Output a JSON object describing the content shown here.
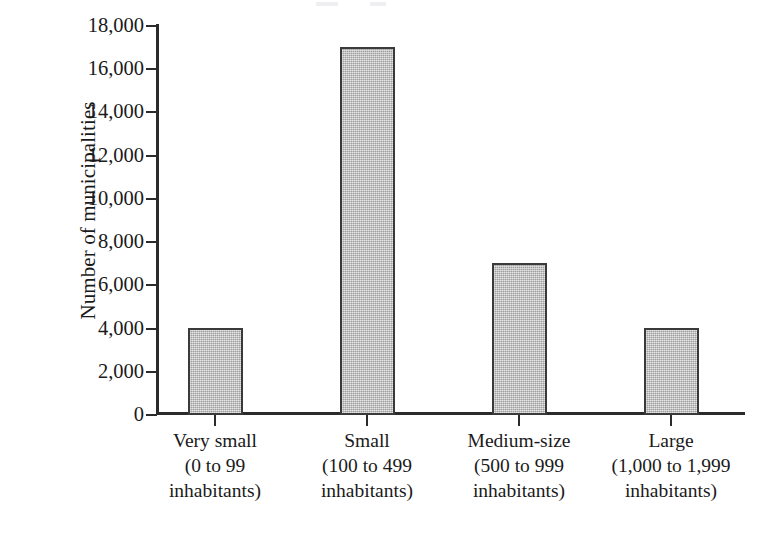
{
  "chart_data": {
    "type": "bar",
    "title": "",
    "subtitle": "",
    "xlabel": "",
    "ylabel": "Number of municipalities",
    "categories": [
      "Very small\n(0 to 99 inhabitants)",
      "Small\n(100 to 499 inhabitants)",
      "Medium-size\n(500 to 999 inhabitants)",
      "Large\n(1,000 to 1,999 inhabitants)"
    ],
    "values": [
      4000,
      17000,
      7000,
      4000
    ],
    "ylim": [
      0,
      18000
    ],
    "y_tick_step": 2000,
    "grid": false,
    "legend": null,
    "bar_fill_color": "#b2b2b2",
    "bar_edge_color": "#3a3a3a",
    "axis_color": "#2b2b2b"
  },
  "axis": {
    "y_title": "Number of municipalities",
    "y_ticks": [
      {
        "label": "18,000",
        "value": 18000
      },
      {
        "label": "16,000",
        "value": 16000
      },
      {
        "label": "14,000",
        "value": 14000
      },
      {
        "label": "12,000",
        "value": 12000
      },
      {
        "label": "10,000",
        "value": 10000
      },
      {
        "label": "8,000",
        "value": 8000
      },
      {
        "label": "6,000",
        "value": 6000
      },
      {
        "label": "4,000",
        "value": 4000
      },
      {
        "label": "2,000",
        "value": 2000
      },
      {
        "label": "0",
        "value": 0
      }
    ],
    "x_categories": [
      {
        "name": "Very small",
        "line1": "Very small",
        "line2": "(0 to 99",
        "line3": "inhabitants)"
      },
      {
        "name": "Small",
        "line1": "Small",
        "line2": "(100 to 499",
        "line3": "inhabitants)"
      },
      {
        "name": "Medium-size",
        "line1": "Medium-size",
        "line2": "(500 to 999",
        "line3": "inhabitants)"
      },
      {
        "name": "Large",
        "line1": "Large",
        "line2": "(1,000 to 1,999",
        "line3": "inhabitants)"
      }
    ]
  }
}
